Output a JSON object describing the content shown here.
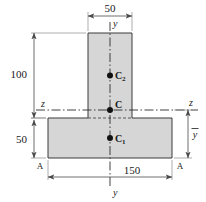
{
  "figure": {
    "type": "engineering-cross-section"
  },
  "dimensions": {
    "flange_width": "150",
    "web_width": "50",
    "web_height": "100",
    "flange_height": "50",
    "centroid_distance": "y"
  },
  "axes": {
    "vertical_top": "y",
    "vertical_bottom": "y",
    "horizontal_left": "z",
    "horizontal_right": "z"
  },
  "points": {
    "composite_centroid": "C",
    "web_centroid": "C",
    "web_centroid_sub": "2",
    "flange_centroid": "C",
    "flange_centroid_sub": "1"
  },
  "section_marks": {
    "left": "A",
    "right": "A"
  },
  "colors": {
    "fill": "#d6d6d6",
    "outline": "#3a3a3a",
    "dimension": "#4a4a4a",
    "background": "#ffffff"
  }
}
